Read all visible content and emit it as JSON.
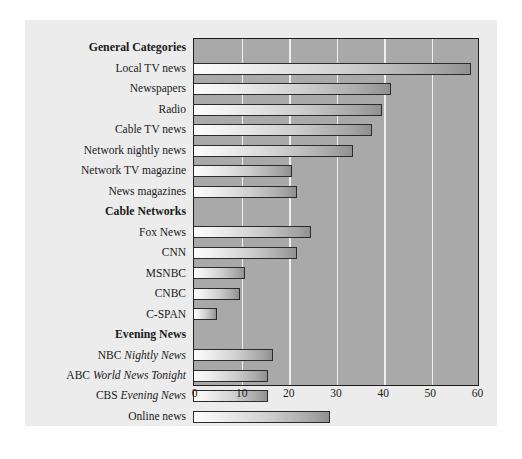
{
  "chart_data": {
    "type": "bar",
    "orientation": "horizontal",
    "title": "",
    "xlabel": "",
    "ylabel": "",
    "xlim": [
      0,
      60
    ],
    "xticks": [
      0,
      10,
      20,
      30,
      40,
      50,
      60
    ],
    "grid": true,
    "legend": "none",
    "groups": [
      {
        "heading": "General Categories",
        "items": [
          {
            "label": "Local TV news",
            "value": 59
          },
          {
            "label": "Newspapers",
            "value": 42
          },
          {
            "label": "Radio",
            "value": 40
          },
          {
            "label": "Cable TV news",
            "value": 38
          },
          {
            "label": "Network nightly news",
            "value": 34
          },
          {
            "label": "Network TV magazine",
            "value": 21
          },
          {
            "label": "News magazines",
            "value": 22
          }
        ]
      },
      {
        "heading": "Cable Networks",
        "items": [
          {
            "label": "Fox News",
            "value": 25
          },
          {
            "label": "CNN",
            "value": 22
          },
          {
            "label": "MSNBC",
            "value": 11
          },
          {
            "label": "CNBC",
            "value": 10
          },
          {
            "label": "C-SPAN",
            "value": 5
          }
        ]
      },
      {
        "heading": "Evening News",
        "items": [
          {
            "label": "NBC Nightly News",
            "label_prefix": "NBC ",
            "label_italic": "Nightly News",
            "value": 17
          },
          {
            "label": "ABC World News Tonight",
            "label_prefix": "ABC ",
            "label_italic": "World News Tonight",
            "value": 16
          },
          {
            "label": "CBS Evening News",
            "label_prefix": "CBS ",
            "label_italic": "Evening News",
            "value": 16
          },
          {
            "label": "Online news",
            "value": 29
          }
        ]
      }
    ],
    "categories": [
      "Local TV news",
      "Newspapers",
      "Radio",
      "Cable TV news",
      "Network nightly news",
      "Network TV magazine",
      "News magazines",
      "Fox News",
      "CNN",
      "MSNBC",
      "CNBC",
      "C-SPAN",
      "NBC Nightly News",
      "ABC World News Tonight",
      "CBS Evening News",
      "Online news"
    ],
    "values": [
      59,
      42,
      40,
      38,
      34,
      21,
      22,
      25,
      22,
      11,
      10,
      5,
      17,
      16,
      16,
      29
    ],
    "colors": {
      "plot_background": "#a9a9a9",
      "panel_background": "#ececec",
      "page_background": "#ffffff",
      "gridline": "#efefef",
      "bar_start": "#fcfcfc",
      "bar_end": "#909090",
      "bar_outline": "#2a2a2a",
      "text": "#1a1a1a"
    }
  }
}
